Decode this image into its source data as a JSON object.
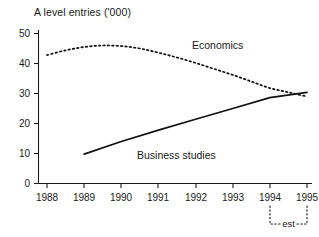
{
  "chart_data": {
    "type": "line",
    "title": "A level entries ('000)",
    "xlabel": "",
    "ylabel": "",
    "xlim": [
      1988,
      1995
    ],
    "ylim": [
      0,
      50
    ],
    "ytick_labels": [
      "0",
      "10",
      "20",
      "30",
      "40",
      "50"
    ],
    "ytick_values": [
      0,
      10,
      20,
      30,
      40,
      50
    ],
    "xtick_labels": [
      "1988",
      "1989",
      "1990",
      "1991",
      "1992",
      "1993",
      "1994",
      "1995"
    ],
    "xtick_values": [
      1988,
      1989,
      1990,
      1991,
      1992,
      1993,
      1994,
      1995
    ],
    "grid": false,
    "legend_position": "inline-annotation",
    "annotations": [
      {
        "name": "estimate-bracket",
        "text": "est",
        "span": [
          1994,
          1995
        ]
      }
    ],
    "series": [
      {
        "name": "Economics",
        "style": "dotted",
        "x": [
          1988,
          1988.5,
          1989,
          1989.5,
          1990,
          1990.5,
          1991,
          1991.5,
          1992,
          1992.5,
          1993,
          1993.5,
          1994,
          1994.5,
          1995
        ],
        "values": [
          42.8,
          44.4,
          45.5,
          46.0,
          45.8,
          45.0,
          43.6,
          42.0,
          40.2,
          38.2,
          36.2,
          34.0,
          31.8,
          30.4,
          29.0
        ]
      },
      {
        "name": "Business studies",
        "style": "solid",
        "x": [
          1989,
          1990,
          1991,
          1992,
          1993,
          1994,
          1995
        ],
        "values": [
          9.8,
          14.0,
          17.8,
          21.4,
          25.0,
          28.6,
          30.4
        ]
      }
    ]
  },
  "labels": {
    "title": "A level entries ('000)",
    "economics": "Economics",
    "business_studies": "Business studies",
    "est": "est"
  },
  "colors": {
    "ink": "#111111",
    "background": "#ffffff"
  }
}
